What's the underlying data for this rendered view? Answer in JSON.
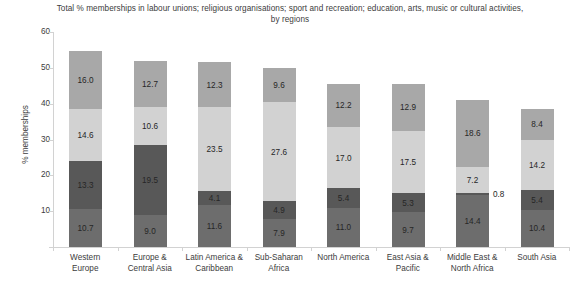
{
  "chart_data": {
    "type": "bar",
    "stacked": true,
    "title": "Total % memberships in labour unions; religious organisations; sport and recreation; education, arts, music or cultural activities, by regions",
    "xlabel": "",
    "ylabel": "% memberships",
    "ylim": [
      0,
      60
    ],
    "yticks": [
      0,
      10,
      20,
      30,
      40,
      50,
      60
    ],
    "ytick_labels": [
      "",
      "10",
      "20",
      "30",
      "40",
      "50",
      "60"
    ],
    "grid": false,
    "legend": "none",
    "categories": [
      "Western Europe",
      "Europe & Central Asia",
      "Latin America & Caribbean",
      "Sub-Saharan Africa",
      "North America",
      "East Asia & Pacific",
      "Middle East & North Africa",
      "South Asia"
    ],
    "category_lines": [
      [
        "Western",
        "Europe"
      ],
      [
        "Europe &",
        "Central Asia"
      ],
      [
        "Latin America &",
        "Caribbean"
      ],
      [
        "Sub-Saharan",
        "Africa"
      ],
      [
        "North America"
      ],
      [
        "East Asia &",
        "Pacific"
      ],
      [
        "Middle East &",
        "North Africa"
      ],
      [
        "South Asia"
      ]
    ],
    "series": [
      {
        "name": "labour unions",
        "color": "#6d6d6d",
        "values": [
          10.7,
          9.0,
          11.6,
          7.9,
          11.0,
          9.7,
          14.4,
          10.4
        ],
        "labels": [
          "10.7",
          "9.0",
          "11.6",
          "7.9",
          "11.0",
          "9.7",
          "14.4",
          "10.4"
        ]
      },
      {
        "name": "religious organisations",
        "color": "#585858",
        "values": [
          13.3,
          19.5,
          4.1,
          4.9,
          5.4,
          5.3,
          0.8,
          5.4
        ],
        "labels": [
          "13.3",
          "19.5",
          "4.1",
          "4.9",
          "5.4",
          "5.3",
          "0.8",
          "5.4"
        ],
        "label_outside": [
          false,
          false,
          false,
          false,
          false,
          false,
          true,
          false
        ]
      },
      {
        "name": "sport and recreation",
        "color": "#d2d2d2",
        "values": [
          14.6,
          10.6,
          23.5,
          27.6,
          17.0,
          17.5,
          7.2,
          14.2
        ],
        "labels": [
          "14.6",
          "10.6",
          "23.5",
          "27.6",
          "17.0",
          "17.5",
          "7.2",
          "14.2"
        ]
      },
      {
        "name": "education, arts, music or cultural activities",
        "color": "#a8a8a8",
        "values": [
          16.0,
          12.7,
          12.3,
          9.6,
          12.2,
          12.9,
          18.6,
          8.4
        ],
        "labels": [
          "16.0",
          "12.7",
          "12.3",
          "9.6",
          "12.2",
          "12.9",
          "18.6",
          "8.4"
        ]
      }
    ],
    "totals": [
      54.6,
      51.8,
      51.5,
      50.0,
      45.6,
      45.4,
      41.0,
      38.4
    ]
  }
}
